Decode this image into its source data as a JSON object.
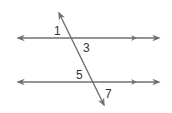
{
  "diagram": {
    "colors": {
      "line": "#707070",
      "text": "#333333",
      "background": "#ffffff"
    },
    "angle_labels": [
      {
        "text": "1",
        "x": 54,
        "y": 35
      },
      {
        "text": "3",
        "x": 83,
        "y": 52
      },
      {
        "text": "5",
        "x": 76,
        "y": 79
      },
      {
        "text": "7",
        "x": 105,
        "y": 98
      }
    ],
    "lines": [
      {
        "name": "parallel-line-top",
        "y": 38,
        "x1": 17,
        "x2": 160
      },
      {
        "name": "parallel-line-bottom",
        "y": 82,
        "x1": 17,
        "x2": 160
      },
      {
        "name": "transversal",
        "x1": 59,
        "y1": 12,
        "x2": 104,
        "y2": 106
      }
    ]
  }
}
